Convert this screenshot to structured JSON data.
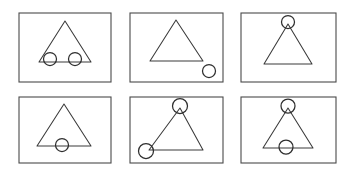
{
  "figure": {
    "width": 353,
    "height": 170,
    "background_color": "#ffffff",
    "frame_color": "#4a4a4a",
    "triangle_color": "#3a3a3a",
    "circle_color": "#2e2e2e",
    "rows": 2,
    "columns": 3,
    "panel_count": 6
  },
  "panels": [
    {
      "id": "panel-1",
      "position": "top-left",
      "row": 1,
      "column": 1,
      "description": "Triangle with two circles on the base line, inside the triangle",
      "frame": {
        "x": 19,
        "y": 13,
        "width": 92,
        "height": 69
      },
      "triangle": {
        "points": "65,21 39,62 91,62",
        "apex": {
          "x": 65,
          "y": 21
        },
        "bottom_left": {
          "x": 39,
          "y": 62
        },
        "bottom_right": {
          "x": 91,
          "y": 62
        }
      },
      "circles": [
        {
          "name": "circle-base-left",
          "cx": 50,
          "cy": 59,
          "r": 6.5
        },
        {
          "name": "circle-base-right",
          "cx": 75,
          "cy": 59,
          "r": 6.5
        }
      ],
      "circle_count": 2
    },
    {
      "id": "panel-2",
      "position": "top-middle",
      "row": 1,
      "column": 2,
      "description": "Triangle with a single circle outside at the bottom right corner",
      "frame": {
        "x": 130,
        "y": 13,
        "width": 93,
        "height": 69
      },
      "triangle": {
        "points": "176,20 150,61 203,61",
        "apex": {
          "x": 176,
          "y": 20
        },
        "bottom_left": {
          "x": 150,
          "y": 61
        },
        "bottom_right": {
          "x": 203,
          "y": 61
        }
      },
      "circles": [
        {
          "name": "circle-outside-bottom-right",
          "cx": 209,
          "cy": 71,
          "r": 6.5
        }
      ],
      "circle_count": 1
    },
    {
      "id": "panel-3",
      "position": "top-right",
      "row": 1,
      "column": 3,
      "description": "Triangle with a single circle at the apex vertex",
      "frame": {
        "x": 241,
        "y": 13,
        "width": 95,
        "height": 69
      },
      "triangle": {
        "points": "288,24 264,64 312,64",
        "apex": {
          "x": 288,
          "y": 24
        },
        "bottom_left": {
          "x": 264,
          "y": 64
        },
        "bottom_right": {
          "x": 312,
          "y": 64
        }
      },
      "circles": [
        {
          "name": "circle-apex",
          "cx": 288,
          "cy": 22,
          "r": 6.5
        }
      ],
      "circle_count": 1
    },
    {
      "id": "panel-4",
      "position": "bottom-left",
      "row": 2,
      "column": 1,
      "description": "Triangle with a single circle centered on the base line",
      "frame": {
        "x": 19,
        "y": 97,
        "width": 92,
        "height": 66
      },
      "triangle": {
        "points": "64,104 37,146 91,146",
        "apex": {
          "x": 64,
          "y": 104
        },
        "bottom_left": {
          "x": 37,
          "y": 146
        },
        "bottom_right": {
          "x": 91,
          "y": 146
        }
      },
      "circles": [
        {
          "name": "circle-base-center",
          "cx": 62,
          "cy": 145,
          "r": 6.5
        }
      ],
      "circle_count": 1
    },
    {
      "id": "panel-5",
      "position": "bottom-middle",
      "row": 2,
      "column": 2,
      "description": "Tilted triangle with circles at the apex and the bottom left vertex",
      "frame": {
        "x": 130,
        "y": 97,
        "width": 93,
        "height": 66
      },
      "triangle": {
        "points": "180,108 149,150 203,150",
        "apex": {
          "x": 180,
          "y": 108
        },
        "bottom_left": {
          "x": 149,
          "y": 150
        },
        "bottom_right": {
          "x": 203,
          "y": 150
        }
      },
      "circles": [
        {
          "name": "circle-apex",
          "cx": 180,
          "cy": 106,
          "r": 7.5
        },
        {
          "name": "circle-bottom-left-vertex",
          "cx": 146,
          "cy": 151,
          "r": 7.5
        }
      ],
      "circle_count": 2
    },
    {
      "id": "panel-6",
      "position": "bottom-right",
      "row": 2,
      "column": 3,
      "description": "Triangle with circles at the apex and centered on the base line",
      "frame": {
        "x": 241,
        "y": 97,
        "width": 95,
        "height": 66
      },
      "triangle": {
        "points": "288,108 263,148 313,148",
        "apex": {
          "x": 288,
          "y": 108
        },
        "bottom_left": {
          "x": 263,
          "y": 148
        },
        "bottom_right": {
          "x": 313,
          "y": 148
        }
      },
      "circles": [
        {
          "name": "circle-apex",
          "cx": 288,
          "cy": 106,
          "r": 7
        },
        {
          "name": "circle-base-center",
          "cx": 286,
          "cy": 147,
          "r": 7
        }
      ],
      "circle_count": 2
    }
  ]
}
